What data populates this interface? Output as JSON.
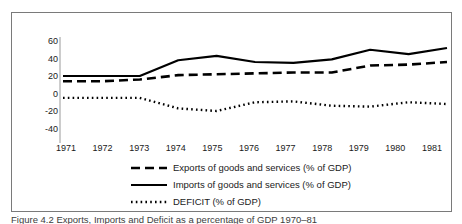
{
  "figure": {
    "caption": "Figure 4.2  Exports, Imports and Deficit as a percentage of GDP 1970–81"
  },
  "chart_data": {
    "type": "line",
    "title": "",
    "subtitle": "",
    "xlabel": "",
    "ylabel": "",
    "x": [
      1971,
      1972,
      1973,
      1974,
      1975,
      1976,
      1977,
      1978,
      1979,
      1980,
      1981
    ],
    "categories": [
      "1971",
      "1972",
      "1973",
      "1974",
      "1975",
      "1976",
      "1977",
      "1978",
      "1979",
      "1980",
      "1981"
    ],
    "ylim": [
      -40,
      60
    ],
    "yticks": [
      60,
      40,
      20,
      0,
      -20,
      -40
    ],
    "ytick_labels": [
      "60",
      "40",
      "20",
      "0",
      "-20",
      "-40"
    ],
    "grid": false,
    "legend_position": "below",
    "series": [
      {
        "name": "Exports of goods and services (% of GDP)",
        "style": "dashed",
        "color": "#000000",
        "values": [
          14,
          14,
          16,
          21,
          22,
          23,
          24,
          24,
          32,
          33,
          36
        ]
      },
      {
        "name": "Imports of goods and services (% of GDP)",
        "style": "solid",
        "color": "#000000",
        "values": [
          20,
          20,
          20,
          38,
          43,
          36,
          35,
          39,
          50,
          45,
          52
        ]
      },
      {
        "name": "DEFICIT (% of GDP)",
        "style": "dotted",
        "color": "#000000",
        "values": [
          -5,
          -5,
          -5,
          -17,
          -20,
          -10,
          -9,
          -14,
          -15,
          -10,
          -12
        ]
      }
    ]
  }
}
